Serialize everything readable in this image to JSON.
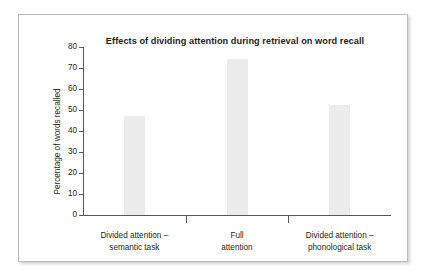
{
  "figure": {
    "background_color": "#ffffff",
    "frame_border_color": "#b9bcc0",
    "axis_color": "#55585c",
    "bar_color": "#ececec",
    "text_color": "#231f20"
  },
  "chart_data": {
    "type": "bar",
    "title": "Effects of dividing attention during retrieval on word recall",
    "xlabel": "",
    "ylabel": "Percentage of words recalled",
    "categories": [
      "Divided attention – semantic task",
      "Full attention",
      "Divided attention – phonological task"
    ],
    "category_lines": [
      [
        "Divided attention –",
        "semantic task"
      ],
      [
        "Full",
        "attention"
      ],
      [
        "Divided attention –",
        "phonological task"
      ]
    ],
    "values": [
      47,
      74.5,
      52.5
    ],
    "ylim": [
      0,
      80
    ],
    "ytick_values": [
      0,
      10,
      20,
      30,
      40,
      50,
      60,
      70,
      80
    ],
    "ytick_labels": [
      "0",
      "10",
      "20",
      "30",
      "40",
      "50",
      "60",
      "70",
      "80"
    ],
    "grid": false,
    "legend": false
  }
}
